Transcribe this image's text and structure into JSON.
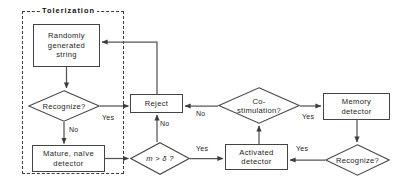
{
  "diagram": {
    "group": {
      "label": "Tolerization",
      "x": 22,
      "y": 11,
      "w": 100,
      "h": 161
    },
    "nodes": [
      {
        "id": "random-string",
        "kind": "process",
        "label": "Randomly\ngenerated\nstring",
        "x": 33,
        "y": 24,
        "w": 67,
        "h": 43
      },
      {
        "id": "recognize-left",
        "kind": "decision",
        "label": "Recognize?",
        "x": 28,
        "y": 90,
        "w": 72,
        "h": 32
      },
      {
        "id": "mature-naive",
        "kind": "process",
        "label": "Mature, naïve\ndetector",
        "x": 32,
        "y": 145,
        "w": 73,
        "h": 27
      },
      {
        "id": "reject",
        "kind": "process",
        "label": "Reject",
        "x": 130,
        "y": 94,
        "w": 53,
        "h": 19
      },
      {
        "id": "m-greater-delta",
        "kind": "decision",
        "label": "m > δ ?",
        "x": 130,
        "y": 142,
        "w": 60,
        "h": 33
      },
      {
        "id": "co-stimulation",
        "kind": "decision",
        "label": "Co-\nstimulation?",
        "x": 218,
        "y": 87,
        "w": 82,
        "h": 37
      },
      {
        "id": "activated-detector",
        "kind": "process",
        "label": "Activated\ndetector",
        "x": 225,
        "y": 144,
        "w": 63,
        "h": 26
      },
      {
        "id": "memory-detector",
        "kind": "process",
        "label": "Memory\ndetector",
        "x": 323,
        "y": 93,
        "w": 67,
        "h": 27
      },
      {
        "id": "recognize-right",
        "kind": "decision",
        "label": "Recognize?",
        "x": 325,
        "y": 144,
        "w": 65,
        "h": 32
      }
    ],
    "edge_labels": [
      {
        "id": "recognize-left-yes",
        "text": "Yes",
        "x": 102,
        "y": 114
      },
      {
        "id": "recognize-left-no",
        "text": "No",
        "x": 69,
        "y": 126
      },
      {
        "id": "m-delta-no",
        "text": "No",
        "x": 160,
        "y": 120
      },
      {
        "id": "m-delta-yes",
        "text": "Yes",
        "x": 196,
        "y": 145
      },
      {
        "id": "co-stimulation-no",
        "text": "No",
        "x": 196,
        "y": 110
      },
      {
        "id": "co-stimulation-yes",
        "text": "Yes",
        "x": 302,
        "y": 113
      },
      {
        "id": "recognize-right-yes",
        "text": "Yes",
        "x": 296,
        "y": 145
      }
    ],
    "colors": {
      "stroke": "#444444",
      "dashed_stroke": "#3a3a3a",
      "text": "#1d1d1d",
      "background": "#ffffff"
    }
  }
}
